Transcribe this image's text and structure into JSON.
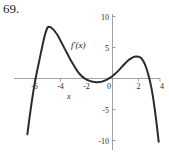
{
  "problem": {
    "number": "69."
  },
  "chart_data": {
    "type": "line",
    "title": "",
    "xlabel": "x",
    "ylabel": "",
    "curve_label": "f'(x)",
    "xlim": [
      -7.2,
      4.2
    ],
    "ylim": [
      -10.8,
      10.6
    ],
    "grid": false,
    "legend_position": "inline-annotation",
    "xticks": [
      -6,
      -4,
      -2,
      0,
      2,
      4
    ],
    "xtick_labels": [
      "-6",
      "-4",
      "-2",
      "0",
      "2",
      "4"
    ],
    "yticks": [
      10,
      5,
      -5,
      -10
    ],
    "ytick_labels": [
      "10",
      "5",
      "-5",
      "-10"
    ],
    "axis_color": "#8a8a8a",
    "curve_color": "#2b2b2b",
    "series": [
      {
        "name": "f'(x)",
        "x": [
          -6.55,
          -6.4,
          -6.2,
          -6.0,
          -5.8,
          -5.6,
          -5.4,
          -5.2,
          -5.0,
          -4.8,
          -4.6,
          -4.4,
          -4.2,
          -4.0,
          -3.8,
          -3.6,
          -3.4,
          -3.2,
          -3.0,
          -2.8,
          -2.6,
          -2.4,
          -2.2,
          -2.0,
          -1.8,
          -1.6,
          -1.4,
          -1.2,
          -1.0,
          -0.8,
          -0.6,
          -0.4,
          -0.2,
          0.0,
          0.2,
          0.4,
          0.6,
          0.8,
          1.0,
          1.2,
          1.4,
          1.6,
          1.8,
          2.0,
          2.2,
          2.4,
          2.6,
          2.8,
          3.0,
          3.2,
          3.4,
          3.55
        ],
        "y": [
          -9.0,
          -6.6,
          -3.6,
          -1.0,
          1.2,
          3.2,
          5.2,
          7.0,
          8.2,
          8.3,
          8.0,
          7.5,
          6.9,
          6.1,
          5.3,
          4.5,
          3.7,
          2.9,
          2.2,
          1.5,
          0.9,
          0.45,
          0.1,
          -0.15,
          -0.35,
          -0.48,
          -0.55,
          -0.6,
          -0.58,
          -0.5,
          -0.35,
          -0.15,
          0.1,
          0.4,
          0.75,
          1.15,
          1.6,
          2.05,
          2.5,
          2.9,
          3.2,
          3.45,
          3.55,
          3.5,
          3.3,
          2.7,
          1.7,
          0.3,
          -1.6,
          -4.2,
          -7.4,
          -10.2
        ]
      }
    ],
    "annotations": [
      {
        "text": "f'(x)",
        "x": -3.2,
        "y": 5.0
      }
    ]
  }
}
